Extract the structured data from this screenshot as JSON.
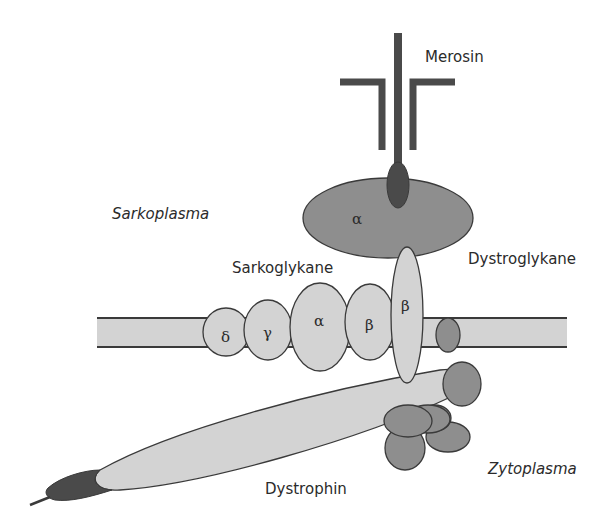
{
  "diagram": {
    "labels": {
      "merosin": "Merosin",
      "sarkoplasma": "Sarkoplasma",
      "sarkoglykane": "Sarkoglykane",
      "dystroglykane": "Dystroglykane",
      "dystrophin": "Dystrophin",
      "zytoplasma": "Zytoplasma"
    },
    "alpha_dystroglycan_label": "α",
    "sarcoglycans": [
      {
        "name": "delta",
        "symbol": "δ"
      },
      {
        "name": "gamma",
        "symbol": "γ"
      },
      {
        "name": "alpha",
        "symbol": "α"
      },
      {
        "name": "beta",
        "symbol": "β"
      }
    ],
    "beta_dystroglycan_label": "β",
    "colors": {
      "light_fill": "#d3d3d3",
      "mid_fill": "#8e8e8e",
      "dark_fill": "#4a4a4a",
      "outline": "#3a3a3a",
      "background": "#ffffff"
    }
  }
}
